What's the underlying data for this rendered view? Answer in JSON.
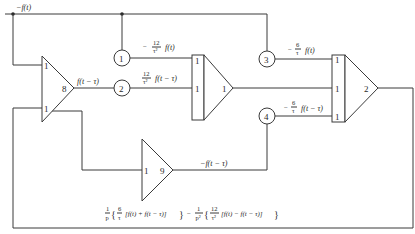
{
  "diagram": {
    "signals": {
      "top_input": "−f(t)",
      "amp8_output": "f(t − τ)",
      "amp9_output": "−f(t − τ)"
    },
    "potentiometers": [
      {
        "id": "1",
        "output_sign": "−",
        "num": "12",
        "den": "τ²",
        "arg": "f(t)"
      },
      {
        "id": "2",
        "output_sign": "",
        "num": "12",
        "den": "τ²",
        "arg": "f(t − τ)"
      },
      {
        "id": "3",
        "output_sign": "−",
        "num": "6",
        "den": "τ",
        "arg": "f(t)"
      },
      {
        "id": "4",
        "output_sign": "−",
        "num": "6",
        "den": "τ",
        "arg": "f(t − τ)"
      }
    ],
    "amplifiers": {
      "amp8": {
        "label": "8",
        "input_gains": [
          "1",
          "1"
        ]
      },
      "amp9": {
        "label": "9",
        "input_gains": [
          "1"
        ]
      },
      "summer1": {
        "label": "1",
        "input_gains": [
          "1",
          "1"
        ]
      },
      "summer2": {
        "label": "2",
        "input_gains": [
          "1",
          "1",
          "1"
        ]
      }
    },
    "output_expression": {
      "t1_num": "1",
      "t1_den": "p",
      "t2_num": "6",
      "t2_den": "τ",
      "t2_body": "[f(t) + f(t − τ)]",
      "minus": "−",
      "t3_num": "1",
      "t3_den": "p²",
      "t4_num": "12",
      "t4_den": "τ²",
      "t4_body": "[f(t) − f(t − τ)]",
      "brace_open": "{",
      "brace_close": "}"
    }
  }
}
